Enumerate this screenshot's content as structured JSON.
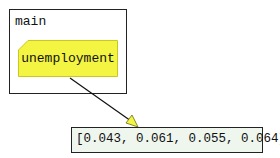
{
  "frame": {
    "label": "main"
  },
  "variable": {
    "name": "unemployment",
    "fill": "#f4f442",
    "stroke": "#c8c820"
  },
  "value": {
    "text": "[0.043, 0.061, 0.055, 0.064]",
    "fill": "#eef6ee"
  },
  "arrow": {
    "color": "#111111",
    "head_fill": "#f4f442"
  }
}
